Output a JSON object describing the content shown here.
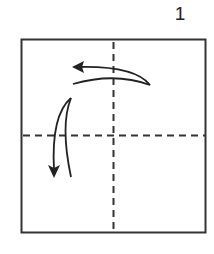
{
  "diagram": {
    "step_number": "1",
    "paper": {
      "shape": "square",
      "border_color": "#333333",
      "fill_color": "#ffffff"
    },
    "fold_lines": [
      {
        "type": "valley-fold",
        "style": "dashed",
        "orientation": "vertical",
        "position": "center"
      },
      {
        "type": "valley-fold",
        "style": "dashed",
        "orientation": "horizontal",
        "position": "center"
      }
    ],
    "arrows": [
      {
        "name": "fold-right-to-left",
        "direction": "left",
        "description": "curved arrow folding right half over to the left"
      },
      {
        "name": "fold-top-to-bottom",
        "direction": "down",
        "description": "curved arrow folding top half down"
      }
    ],
    "colors": {
      "line": "#333333",
      "background": "#ffffff"
    }
  }
}
